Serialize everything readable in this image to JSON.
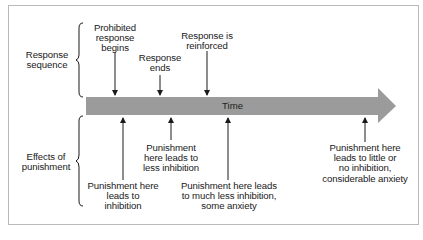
{
  "diagram": {
    "colors": {
      "arrow_fill": "#9b9b9b",
      "line": "#1a1a1a",
      "frame": "#b9b9b9"
    },
    "timeline_label": "Time",
    "groups": {
      "response_sequence": "Response\nsequence",
      "effects_of_punishment": "Effects of\npunishment"
    },
    "response_events": [
      {
        "label": "Prohibited\nresponse\nbegins"
      },
      {
        "label": "Response\nends"
      },
      {
        "label": "Response is\nreinforced"
      }
    ],
    "punishment_effects": [
      {
        "label": "Punishment here\nleads to\ninhibition"
      },
      {
        "label": "Punishment\nhere leads to\nless inhibition"
      },
      {
        "label": "Punishment here leads\nto much less inhibition,\nsome anxiety"
      },
      {
        "label": "Punishment here\nleads to little or\nno inhibition,\nconsiderable anxiety"
      }
    ]
  }
}
